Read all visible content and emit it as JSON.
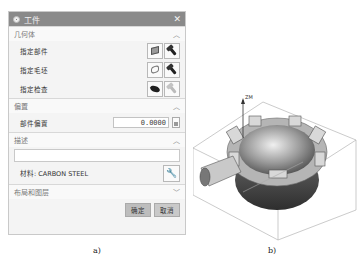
{
  "dialog": {
    "title": "工件",
    "close_icon": "close-icon",
    "geometry": {
      "header": "几何体",
      "rows": [
        {
          "label": "指定部件",
          "icons": [
            "part-cube-icon",
            "flashlight-icon"
          ]
        },
        {
          "label": "指定毛坯",
          "icons": [
            "blank-wire-cube-icon",
            "flashlight-icon"
          ]
        },
        {
          "label": "指定检查",
          "icons": [
            "check-solid-icon",
            "flashlight-disabled-icon"
          ]
        }
      ]
    },
    "offset": {
      "header": "偏置",
      "label": "部件偏置",
      "value": "0.0000",
      "lock_icon": "lock-icon"
    },
    "description": {
      "header": "描述",
      "value": "",
      "material_label": "材料: CARBON STEEL",
      "wrench_icon": "wrench-icon"
    },
    "layout": {
      "header": "布局和图层"
    },
    "buttons": {
      "ok": "确定",
      "cancel": "取消"
    }
  },
  "captions": {
    "a": "a)",
    "b": "b)"
  },
  "model": {
    "axis_label": "ZM"
  }
}
